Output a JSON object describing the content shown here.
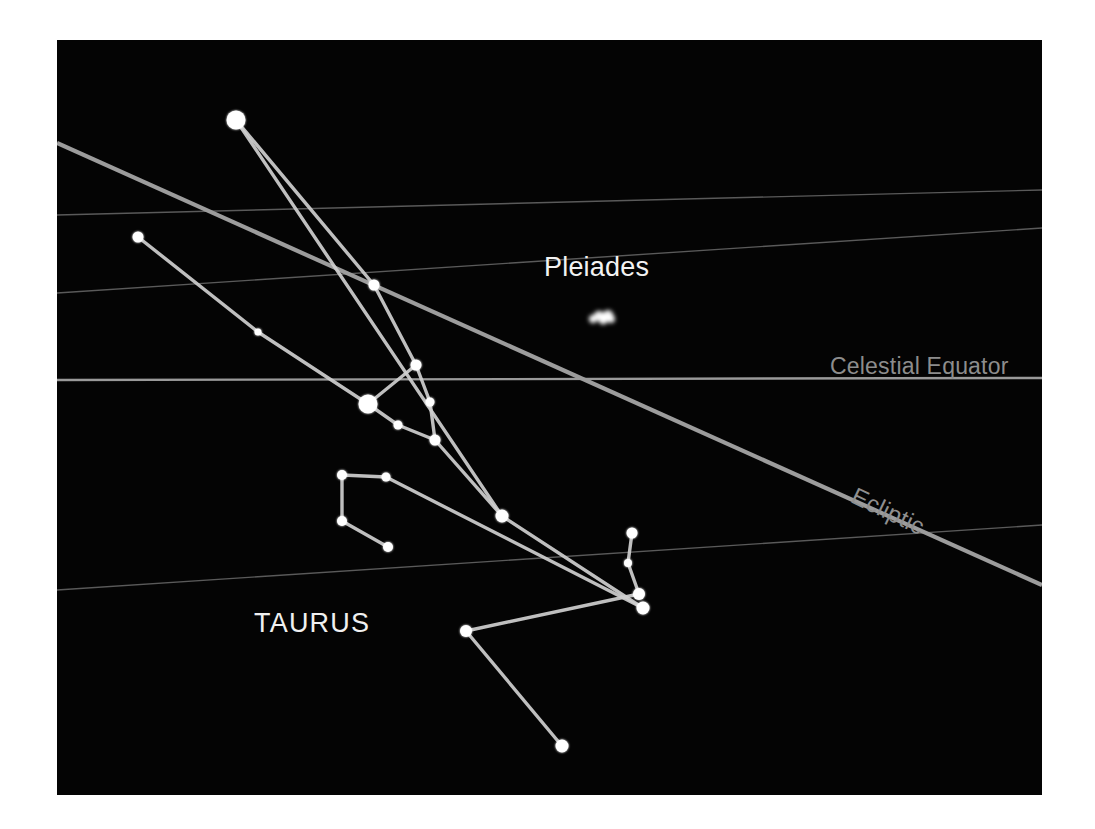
{
  "panel": {
    "background": "#040404",
    "page_background": "#ffffff",
    "left": 57,
    "top": 40,
    "width": 985,
    "height": 755
  },
  "labels": {
    "pleiades": "Pleiades",
    "taurus": "TAURUS",
    "celestial_equator": "Celestial Equator",
    "ecliptic": "Ecliptic"
  },
  "colors": {
    "star": "#ffffff",
    "constellation_line": "#cfcfcf",
    "grid_line": "#5a5a5a",
    "equator_line": "#9a9a9a",
    "ecliptic_line": "#9c9c9c",
    "label_bright": "#f2f2f2",
    "label_dim": "#8d8d8d"
  },
  "chart_data": {
    "type": "scatter",
    "coordinate_space": "panel pixels (985 x 755), origin at panel top-left",
    "annotations": [
      {
        "name": "Pleiades",
        "x": 540,
        "y": 235,
        "style": "bright"
      },
      {
        "name": "TAURUS",
        "x": 255,
        "y": 590,
        "style": "bright"
      },
      {
        "name": "Celestial Equator",
        "x": 850,
        "y": 325,
        "style": "dim"
      },
      {
        "name": "Ecliptic",
        "x": 880,
        "y": 470,
        "style": "dim-rotated"
      }
    ],
    "reference_lines": [
      {
        "name": "declination-grid-1",
        "x1": 0,
        "y1": 175,
        "x2": 985,
        "y2": 150,
        "kind": "grid"
      },
      {
        "name": "declination-grid-2",
        "x1": 0,
        "y1": 253,
        "x2": 985,
        "y2": 188,
        "kind": "grid"
      },
      {
        "name": "celestial-equator",
        "x1": 0,
        "y1": 340,
        "x2": 985,
        "y2": 338,
        "kind": "equator"
      },
      {
        "name": "declination-grid-3",
        "x1": 0,
        "y1": 550,
        "x2": 985,
        "y2": 485,
        "kind": "grid"
      },
      {
        "name": "ecliptic",
        "x1": 0,
        "y1": 103,
        "x2": 985,
        "y2": 545,
        "kind": "ecliptic"
      }
    ],
    "stars": [
      {
        "id": "s1",
        "label": "Elnath",
        "x": 179,
        "y": 80,
        "r": 9.5,
        "magnitude_rank": 1
      },
      {
        "id": "s2",
        "label": "",
        "x": 81,
        "y": 197,
        "r": 5.5,
        "magnitude_rank": 3
      },
      {
        "id": "s3",
        "label": "",
        "x": 201,
        "y": 292,
        "r": 3.5,
        "magnitude_rank": 5
      },
      {
        "id": "s4",
        "label": "",
        "x": 317,
        "y": 245,
        "r": 5.5,
        "magnitude_rank": 3
      },
      {
        "id": "s5",
        "label": "Aldebaran",
        "x": 311,
        "y": 364,
        "r": 9.5,
        "magnitude_rank": 1
      },
      {
        "id": "s6",
        "label": "",
        "x": 359,
        "y": 325,
        "r": 5.5,
        "magnitude_rank": 3
      },
      {
        "id": "s7",
        "label": "",
        "x": 373,
        "y": 362,
        "r": 4.5,
        "magnitude_rank": 4
      },
      {
        "id": "s8",
        "label": "",
        "x": 341,
        "y": 385,
        "r": 4.5,
        "magnitude_rank": 4
      },
      {
        "id": "s9",
        "label": "",
        "x": 378,
        "y": 400,
        "r": 5.5,
        "magnitude_rank": 3
      },
      {
        "id": "s10",
        "label": "",
        "x": 445,
        "y": 476,
        "r": 6.5,
        "magnitude_rank": 2
      },
      {
        "id": "s11",
        "label": "",
        "x": 285,
        "y": 435,
        "r": 5.0,
        "magnitude_rank": 3
      },
      {
        "id": "s12",
        "label": "",
        "x": 329,
        "y": 437,
        "r": 4.5,
        "magnitude_rank": 4
      },
      {
        "id": "s13",
        "label": "",
        "x": 285,
        "y": 481,
        "r": 5.0,
        "magnitude_rank": 3
      },
      {
        "id": "s14",
        "label": "",
        "x": 331,
        "y": 507,
        "r": 5.0,
        "magnitude_rank": 3
      },
      {
        "id": "s15",
        "label": "",
        "x": 575,
        "y": 493,
        "r": 5.5,
        "magnitude_rank": 3
      },
      {
        "id": "s16",
        "label": "",
        "x": 571,
        "y": 523,
        "r": 4.0,
        "magnitude_rank": 4
      },
      {
        "id": "s17",
        "label": "",
        "x": 582,
        "y": 554,
        "r": 6.0,
        "magnitude_rank": 2
      },
      {
        "id": "s18",
        "label": "",
        "x": 586,
        "y": 568,
        "r": 6.5,
        "magnitude_rank": 2
      },
      {
        "id": "s19",
        "label": "",
        "x": 409,
        "y": 591,
        "r": 6.0,
        "magnitude_rank": 2
      },
      {
        "id": "s20",
        "label": "",
        "x": 505,
        "y": 706,
        "r": 6.5,
        "magnitude_rank": 2
      }
    ],
    "cluster_blob": {
      "name": "Pleiades cluster",
      "x": 545,
      "y": 277,
      "width": 26,
      "height": 13
    },
    "constellation_lines": [
      [
        "s1",
        "s4"
      ],
      [
        "s4",
        "s6"
      ],
      [
        "s2",
        "s3"
      ],
      [
        "s3",
        "s5"
      ],
      [
        "s5",
        "s6"
      ],
      [
        "s5",
        "s8"
      ],
      [
        "s6",
        "s7"
      ],
      [
        "s7",
        "s9"
      ],
      [
        "s8",
        "s9"
      ],
      [
        "s9",
        "s10"
      ],
      [
        "s1",
        "s10"
      ],
      [
        "s10",
        "s18"
      ],
      [
        "s11",
        "s12"
      ],
      [
        "s11",
        "s13"
      ],
      [
        "s13",
        "s14"
      ],
      [
        "s12",
        "s18"
      ],
      [
        "s15",
        "s16"
      ],
      [
        "s16",
        "s17"
      ],
      [
        "s17",
        "s19"
      ],
      [
        "s19",
        "s20"
      ]
    ]
  }
}
